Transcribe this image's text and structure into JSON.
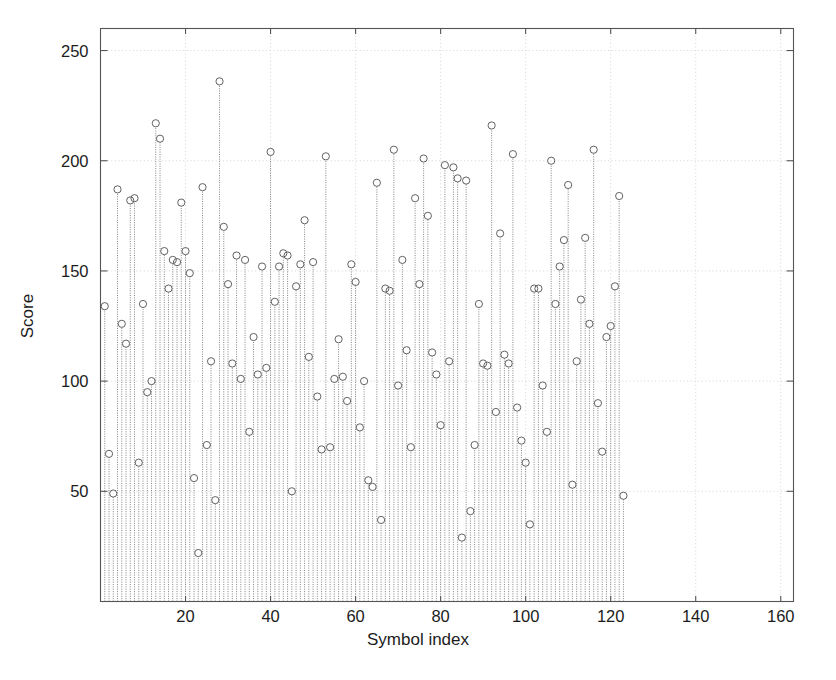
{
  "figure": {
    "background": "#ffffff",
    "axes_color": "#555555",
    "grid_color": "#cfcfcf",
    "stem_color": "#6e6e6e",
    "marker_color": "#5a5a5a"
  },
  "chart_data": {
    "type": "line",
    "plot_style": "stem",
    "title": "",
    "xlabel": "Symbol index",
    "ylabel": "Score",
    "xlim": [
      0,
      163
    ],
    "ylim": [
      0,
      260
    ],
    "xticks": [
      20,
      40,
      60,
      80,
      100,
      120,
      140,
      160
    ],
    "xtick_labels": [
      "20",
      "40",
      "60",
      "80",
      "100",
      "120",
      "140",
      "160"
    ],
    "yticks": [
      50,
      100,
      150,
      200,
      250
    ],
    "ytick_labels": [
      "50",
      "100",
      "150",
      "200",
      "250"
    ],
    "grid": true,
    "grid_axis": "y",
    "marker": "circle-open",
    "baseline": 0,
    "x": [
      1,
      2,
      3,
      4,
      5,
      6,
      7,
      8,
      9,
      10,
      11,
      12,
      13,
      14,
      15,
      16,
      17,
      18,
      19,
      20,
      21,
      22,
      23,
      24,
      25,
      26,
      27,
      28,
      29,
      30,
      31,
      32,
      33,
      34,
      35,
      36,
      37,
      38,
      39,
      40,
      41,
      42,
      43,
      44,
      45,
      46,
      47,
      48,
      49,
      50,
      51,
      52,
      53,
      54,
      55,
      56,
      57,
      58,
      59,
      60,
      61,
      62,
      63,
      64,
      65,
      66,
      67,
      68,
      69,
      70,
      71,
      72,
      73,
      74,
      75,
      76,
      77,
      78,
      79,
      80,
      81,
      82,
      83,
      84,
      85,
      86,
      87,
      88,
      89,
      90,
      91,
      92,
      93,
      94,
      95,
      96,
      97,
      98,
      99,
      100,
      101,
      102,
      103,
      104,
      105,
      106,
      107,
      108,
      109,
      110,
      111,
      112,
      113,
      114,
      115,
      116,
      117,
      118,
      119,
      120,
      121,
      122,
      123,
      124,
      125,
      126,
      127,
      128,
      129,
      130,
      131,
      132,
      133,
      134,
      135,
      136,
      137,
      138,
      139,
      140,
      141,
      142,
      143,
      144,
      145,
      146,
      147,
      148,
      149,
      150,
      151,
      152,
      153,
      154,
      155,
      156,
      157,
      158,
      159,
      160,
      161,
      162
    ],
    "y": [
      134,
      67,
      49,
      187,
      126,
      117,
      182,
      183,
      63,
      135,
      95,
      100,
      217,
      210,
      159,
      142,
      155,
      154,
      181,
      159,
      149,
      56,
      22,
      188,
      71,
      109,
      46,
      236,
      170,
      144,
      108,
      157,
      101,
      155,
      77,
      120,
      103,
      152,
      106,
      204,
      136,
      152,
      158,
      157,
      50,
      143,
      153,
      173,
      111,
      154,
      93,
      69,
      202,
      70,
      101,
      119,
      102,
      91,
      153,
      145,
      79,
      100,
      55,
      52,
      190,
      37,
      142,
      141,
      205,
      98,
      155,
      114,
      70,
      183,
      144,
      201,
      175,
      113,
      103,
      80,
      198,
      109,
      197,
      192,
      29,
      191,
      41,
      71,
      135,
      108,
      107,
      216,
      86,
      167,
      112,
      108,
      203,
      88,
      73,
      63,
      35,
      142,
      142,
      98,
      77,
      200,
      135,
      152,
      164,
      189,
      53,
      109,
      137,
      165,
      126,
      205,
      90,
      68,
      120,
      125,
      143,
      184,
      48
    ],
    "n_points": 162
  },
  "axis": {
    "ylabel_text": "Score",
    "xlabel_text": "Symbol index"
  }
}
